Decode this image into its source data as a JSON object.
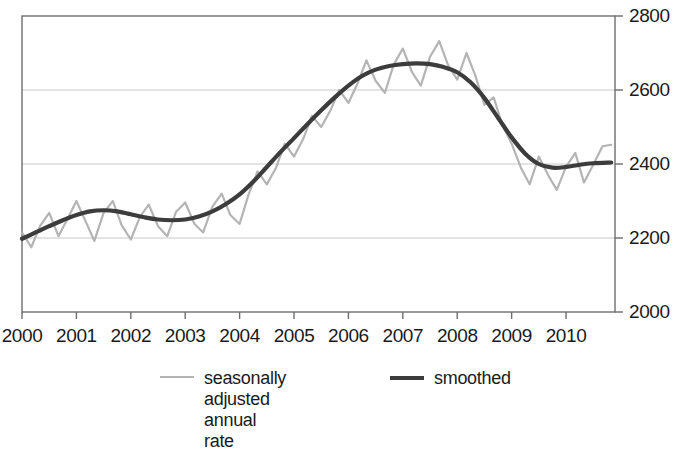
{
  "chart_data": {
    "type": "line",
    "title": "",
    "subtitle": "",
    "xlabel": "",
    "ylabel": "",
    "xlim": [
      2000.0,
      2010.9
    ],
    "ylim": [
      2000,
      2800
    ],
    "grid": true,
    "grid_axis": "y",
    "y_axis_position": "right",
    "legend_position": "bottom",
    "x_ticks": [
      2000,
      2001,
      2002,
      2003,
      2004,
      2005,
      2006,
      2007,
      2008,
      2009,
      2010
    ],
    "x_tick_labels": [
      "2000",
      "2001",
      "2002",
      "2003",
      "2004",
      "2005",
      "2006",
      "2007",
      "2008",
      "2009",
      "2010"
    ],
    "y_ticks": [
      2000,
      2200,
      2400,
      2600,
      2800
    ],
    "y_tick_labels": [
      "2000",
      "2200",
      "2400",
      "2600",
      "2800"
    ],
    "series": [
      {
        "name": "seasonally adjusted annual rate",
        "color": "#b4b4b4",
        "width": 2.2,
        "x": [
          2000.0,
          2000.17,
          2000.33,
          2000.5,
          2000.67,
          2000.83,
          2001.0,
          2001.17,
          2001.33,
          2001.5,
          2001.67,
          2001.83,
          2002.0,
          2002.17,
          2002.33,
          2002.5,
          2002.67,
          2002.83,
          2003.0,
          2003.17,
          2003.33,
          2003.5,
          2003.67,
          2003.83,
          2004.0,
          2004.17,
          2004.33,
          2004.5,
          2004.67,
          2004.83,
          2005.0,
          2005.17,
          2005.33,
          2005.5,
          2005.67,
          2005.83,
          2006.0,
          2006.17,
          2006.33,
          2006.5,
          2006.67,
          2006.83,
          2007.0,
          2007.17,
          2007.33,
          2007.5,
          2007.67,
          2007.83,
          2008.0,
          2008.17,
          2008.33,
          2008.5,
          2008.67,
          2008.83,
          2009.0,
          2009.17,
          2009.33,
          2009.5,
          2009.67,
          2009.83,
          2010.0,
          2010.17,
          2010.33,
          2010.5,
          2010.67,
          2010.83
        ],
        "y": [
          2215,
          2175,
          2232,
          2268,
          2205,
          2250,
          2300,
          2245,
          2192,
          2268,
          2300,
          2235,
          2196,
          2258,
          2290,
          2232,
          2205,
          2270,
          2296,
          2238,
          2215,
          2285,
          2320,
          2262,
          2238,
          2320,
          2380,
          2345,
          2390,
          2455,
          2420,
          2468,
          2530,
          2500,
          2545,
          2600,
          2565,
          2618,
          2680,
          2625,
          2592,
          2668,
          2712,
          2648,
          2612,
          2690,
          2732,
          2668,
          2628,
          2700,
          2640,
          2560,
          2580,
          2505,
          2455,
          2390,
          2345,
          2420,
          2370,
          2330,
          2392,
          2430,
          2350,
          2398,
          2448,
          2452
        ]
      },
      {
        "name": "smoothed",
        "color": "#3c3c3c",
        "width": 4.2,
        "x": [
          2000.0,
          2000.25,
          2000.5,
          2000.75,
          2001.0,
          2001.25,
          2001.5,
          2001.75,
          2002.0,
          2002.25,
          2002.5,
          2002.75,
          2003.0,
          2003.25,
          2003.5,
          2003.75,
          2004.0,
          2004.25,
          2004.5,
          2004.75,
          2005.0,
          2005.25,
          2005.5,
          2005.75,
          2006.0,
          2006.25,
          2006.5,
          2006.75,
          2007.0,
          2007.25,
          2007.5,
          2007.75,
          2008.0,
          2008.25,
          2008.5,
          2008.75,
          2009.0,
          2009.25,
          2009.5,
          2009.75,
          2010.0,
          2010.25,
          2010.5,
          2010.83
        ],
        "y": [
          2198,
          2215,
          2232,
          2248,
          2262,
          2272,
          2275,
          2272,
          2264,
          2256,
          2250,
          2248,
          2250,
          2258,
          2272,
          2292,
          2318,
          2352,
          2392,
          2432,
          2470,
          2508,
          2545,
          2580,
          2612,
          2638,
          2655,
          2665,
          2670,
          2672,
          2670,
          2662,
          2648,
          2620,
          2578,
          2525,
          2472,
          2428,
          2400,
          2390,
          2392,
          2398,
          2402,
          2404
        ]
      }
    ]
  },
  "legend": {
    "entries": [
      {
        "label": "seasonally adjusted\nannual rate",
        "color": "#b4b4b4",
        "width": 2.6
      },
      {
        "label": "smoothed",
        "color": "#3c3c3c",
        "width": 4.2
      }
    ]
  },
  "axes": {
    "frame_color": "#6e6e6e",
    "grid_color": "#c8c8c8",
    "tick_color": "#6e6e6e"
  }
}
